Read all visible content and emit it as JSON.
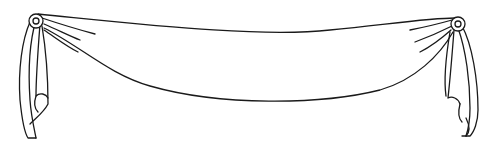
{
  "illustration": {
    "subject": "banner swag drape line drawing",
    "colors": {
      "background": "#ffffff",
      "stroke": "#1a1a1a"
    },
    "parts": [
      "left-rosette",
      "right-rosette",
      "swag-body",
      "left-tail",
      "right-tail"
    ]
  }
}
